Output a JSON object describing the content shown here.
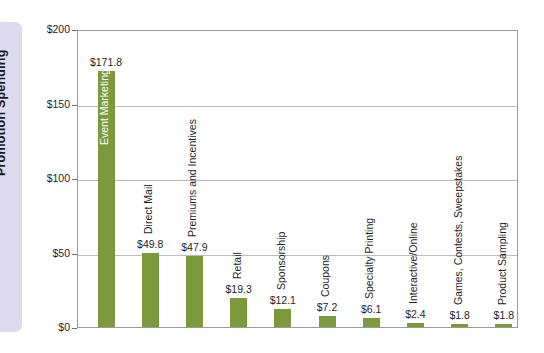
{
  "chart_data": {
    "type": "bar",
    "title": "",
    "xlabel": "",
    "ylabel": "Promotion Spending",
    "ylim": [
      0,
      200
    ],
    "ytick_labels": [
      "$0",
      "$50",
      "$100",
      "$150",
      "$200"
    ],
    "ytick_values": [
      0,
      50,
      100,
      150,
      200
    ],
    "grid": true,
    "legend": "none",
    "orientation": "vertical",
    "bar_color": "#7a9a3c",
    "categories": [
      "Event Marketing",
      "Direct Mail",
      "Premiums and Incentives",
      "Retail",
      "Sponsorship",
      "Coupons",
      "Specialty Printing",
      "Interactive/Online",
      "Games, Contests, Sweepstakes",
      "Product Sampling"
    ],
    "values": [
      171.8,
      49.8,
      47.9,
      19.3,
      12.1,
      7.2,
      6.1,
      2.4,
      1.8,
      1.8
    ],
    "value_labels": [
      "$171.8",
      "$49.8",
      "$47.9",
      "$19.3",
      "$12.1",
      "$7.2",
      "$6.1",
      "$2.4",
      "$1.8",
      "$1.8"
    ],
    "label_placement": [
      "inside-bar",
      "above-bar",
      "above-bar",
      "above-bar",
      "above-bar",
      "above-bar",
      "above-bar",
      "above-bar",
      "above-bar",
      "above-bar"
    ]
  },
  "colors": {
    "bar": "#7a9a3c",
    "panel": "#dcdaec",
    "gridline": "#bcbcbc",
    "axis": "#9a9a9a",
    "text": "#1f1f1f"
  }
}
